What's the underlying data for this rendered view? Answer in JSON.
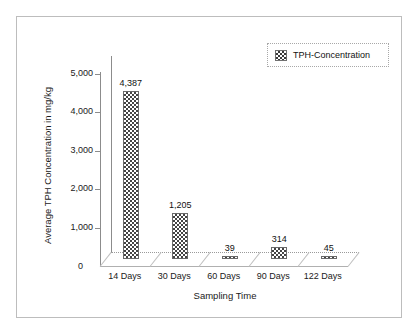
{
  "chart_data": {
    "type": "bar",
    "title": "",
    "xlabel": "Sampling Time",
    "ylabel": "Average TPH Concentration in mg/kg",
    "categories": [
      "14 Days",
      "30 Days",
      "60 Days",
      "90 Days",
      "122 Days"
    ],
    "values": [
      4387,
      1205,
      39,
      314,
      45
    ],
    "value_labels": [
      "4,387",
      "1,205",
      "39",
      "314",
      "45"
    ],
    "series": [
      {
        "name": "TPH-Concentration",
        "values": [
          4387,
          1205,
          39,
          314,
          45
        ]
      }
    ],
    "ylim": [
      0,
      5000
    ],
    "ytick_labels": [
      "0",
      "1,000",
      "2,000",
      "3,000",
      "4,000",
      "5,000"
    ],
    "ytick_values": [
      0,
      1000,
      2000,
      3000,
      4000,
      5000
    ],
    "grid": false,
    "legend_position": "top-right",
    "legend_entries": [
      "TPH-Concentration"
    ],
    "style": "3d-bar",
    "colors": {
      "bar_fill": "#444444",
      "bar_outline": "#6a6a6a",
      "axis": "#8c8c8c",
      "text": "#1a1a1a",
      "frame": "#bdbdbd"
    }
  },
  "legend": {
    "label": "TPH-Concentration"
  },
  "axes": {
    "y_title": "Average TPH Concentration in mg/kg",
    "x_title": "Sampling Time",
    "zero": "0"
  }
}
